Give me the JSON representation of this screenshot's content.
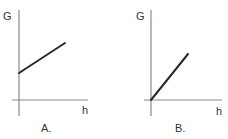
{
  "panels": [
    {
      "id": "A",
      "caption": "A.",
      "y_axis_label": "G",
      "x_axis_label": "h",
      "description": "Straight line with positive slope and positive y-intercept",
      "line": {
        "x1": 19,
        "y1": 73,
        "x2": 65,
        "y2": 43
      },
      "axes": {
        "vx": 19,
        "vy1": 10,
        "vy2": 116,
        "hy": 100,
        "hx1": 12,
        "hx2": 88
      }
    },
    {
      "id": "B",
      "caption": "B.",
      "y_axis_label": "G",
      "x_axis_label": "h",
      "description": "Straight line through the origin with positive slope",
      "line": {
        "x1": 151,
        "y1": 100,
        "x2": 188,
        "y2": 54
      },
      "axes": {
        "vx": 151,
        "vy1": 10,
        "vy2": 116,
        "hy": 100,
        "hx1": 144,
        "hx2": 222
      }
    }
  ],
  "colors": {
    "axis": "#8a8a8a",
    "line": "#2a2a2a",
    "text": "#333333",
    "background": "#ffffff"
  }
}
